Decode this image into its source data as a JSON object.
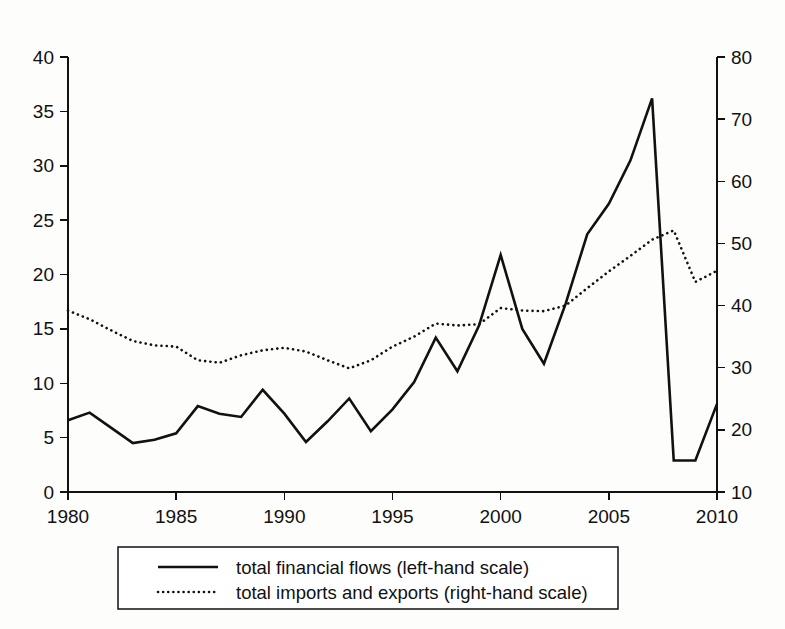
{
  "chart_data": {
    "type": "line",
    "title": "",
    "subtitle": "",
    "xlabel": "",
    "ylabel": "",
    "grid": false,
    "legend_position": "bottom",
    "x": [
      1980,
      1981,
      1982,
      1983,
      1984,
      1985,
      1986,
      1987,
      1988,
      1989,
      1990,
      1991,
      1992,
      1993,
      1994,
      1995,
      1996,
      1997,
      1998,
      1999,
      2000,
      2001,
      2002,
      2003,
      2004,
      2005,
      2006,
      2007,
      2008,
      2009,
      2010
    ],
    "x_tick_labels": [
      "1980",
      "1985",
      "1990",
      "1995",
      "2000",
      "2005",
      "2010"
    ],
    "x_ticks": [
      1980,
      1985,
      1990,
      1995,
      2000,
      2005,
      2010
    ],
    "xlim": [
      1980,
      2010
    ],
    "axes": [
      {
        "id": "left",
        "name": "left-hand scale",
        "ylim": [
          0,
          40
        ],
        "ticks": [
          0,
          5,
          10,
          15,
          20,
          25,
          30,
          35,
          40
        ],
        "tick_labels": [
          "0",
          "5",
          "10",
          "15",
          "20",
          "25",
          "30",
          "35",
          "40"
        ]
      },
      {
        "id": "right",
        "name": "right-hand scale",
        "ylim": [
          10,
          80
        ],
        "ticks": [
          10,
          20,
          30,
          40,
          50,
          60,
          70,
          80
        ],
        "tick_labels": [
          "10",
          "20",
          "30",
          "40",
          "50",
          "60",
          "70",
          "80"
        ]
      }
    ],
    "series": [
      {
        "name": "total financial flows (left-hand scale)",
        "short_name": "total financial flows",
        "axis": "left",
        "style": "solid",
        "color": "#111111",
        "values": [
          6.6,
          7.3,
          5.9,
          4.5,
          4.8,
          5.4,
          7.9,
          7.2,
          6.9,
          9.4,
          7.2,
          4.6,
          6.5,
          8.6,
          5.6,
          7.6,
          10.1,
          14.2,
          11.1,
          15.3,
          21.8,
          15.0,
          11.8,
          17.3,
          23.7,
          26.5,
          30.5,
          36.2,
          2.9,
          2.9,
          8.1
        ]
      },
      {
        "name": "total imports and exports (right-hand scale)",
        "short_name": "total imports and exports",
        "axis": "right",
        "style": "dotted",
        "color": "#111111",
        "values": [
          39.2,
          37.8,
          36.0,
          34.3,
          33.6,
          33.4,
          31.2,
          30.8,
          32.0,
          32.8,
          33.2,
          32.6,
          31.2,
          29.9,
          31.2,
          33.4,
          35.0,
          37.1,
          36.8,
          37.0,
          39.6,
          39.2,
          39.1,
          40.0,
          42.8,
          45.5,
          48.0,
          50.6,
          52.1,
          43.8,
          45.6
        ]
      }
    ],
    "legend": [
      {
        "label": "total financial flows (left-hand scale)",
        "style": "solid"
      },
      {
        "label": "total imports and exports (right-hand scale)",
        "style": "dotted"
      }
    ]
  },
  "figure": {
    "plot_area": {
      "left": 68,
      "right": 717,
      "top": 57,
      "bottom": 492
    },
    "legend_box": {
      "x": 118,
      "y": 547,
      "width": 500,
      "height": 62
    }
  }
}
